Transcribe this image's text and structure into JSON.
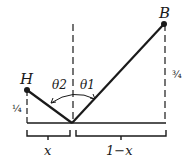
{
  "diagram": {
    "points": {
      "H": {
        "label": "H"
      },
      "B": {
        "label": "B"
      }
    },
    "angles": {
      "theta1": "θ1",
      "theta2": "θ2"
    },
    "heights": {
      "H_height": "¼",
      "B_height": "¾"
    },
    "segments": {
      "left": "x",
      "right": "1−x"
    },
    "colors": {
      "ink": "#1a1a1a",
      "background": "#ffffff"
    }
  }
}
